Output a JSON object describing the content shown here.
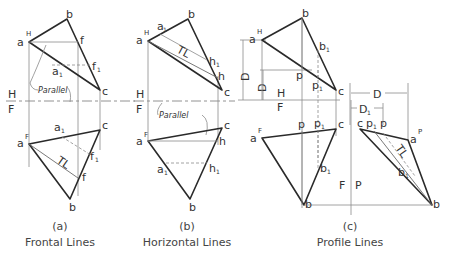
{
  "panels": [
    {
      "id": "a",
      "caption_letter": "(a)",
      "caption_title": "Frontal Lines",
      "annotation": "Parallel",
      "tl_label": "TL",
      "fold_labels": [
        "H",
        "F"
      ],
      "points_top": {
        "a": "a",
        "a_sup": "H",
        "b": "b",
        "c": "c",
        "f": "f",
        "a1": "a",
        "a1_sub": "1",
        "f1": "f",
        "f1_sub": "1"
      },
      "points_bottom": {
        "a": "a",
        "a_sup": "F",
        "b": "b",
        "c": "c",
        "f": "f",
        "a1": "a",
        "a1_sub": "1",
        "f1": "f",
        "f1_sub": "1"
      }
    },
    {
      "id": "b",
      "caption_letter": "(b)",
      "caption_title": "Horizontal Lines",
      "annotation": "Parallel",
      "tl_label": "TL",
      "fold_labels": [
        "H",
        "F"
      ],
      "points_top": {
        "a": "a",
        "a_sup": "H",
        "b": "b",
        "c": "c",
        "h": "h",
        "a1": "a",
        "a1_sub": "1",
        "h1": "h",
        "h1_sub": "1"
      },
      "points_bottom": {
        "a": "a",
        "a_sup": "F",
        "b": "b",
        "c": "c",
        "h": "h",
        "a1": "a",
        "a1_sub": "1",
        "h1": "h",
        "h1_sub": "1"
      }
    },
    {
      "id": "c",
      "caption_letter": "(c)",
      "caption_title": "Profile Lines",
      "tl_label": "TL",
      "fold_labels": [
        "H",
        "F",
        "F",
        "P"
      ],
      "dimensions": {
        "D": "D",
        "D1": "D",
        "D1_sub": "1"
      },
      "points_top": {
        "a": "a",
        "a_sup": "H",
        "b": "b",
        "c": "c",
        "p": "p",
        "b1": "b",
        "b1_sub": "1",
        "p1": "p",
        "p1_sub": "1"
      },
      "points_front": {
        "a": "a",
        "a_sup": "F",
        "b": "b",
        "c": "c",
        "p": "p",
        "b1": "b",
        "b1_sub": "1",
        "p1": "p",
        "p1_sub": "1"
      },
      "points_profile": {
        "a": "a",
        "a_sup": "P",
        "b": "b",
        "c": "c",
        "p": "p",
        "b1": "b",
        "b1_sub": "1",
        "p1": "p",
        "p1_sub": "1"
      }
    }
  ]
}
